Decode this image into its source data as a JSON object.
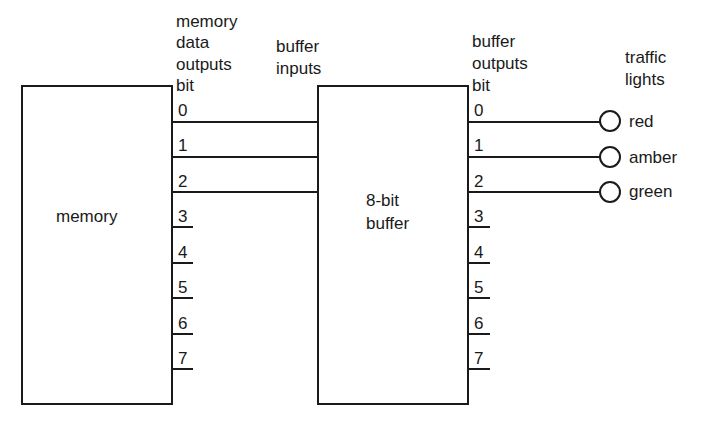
{
  "diagram": {
    "memory_block": {
      "label": "memory",
      "header_lines": [
        "memory",
        "data",
        "outputs",
        "bit"
      ],
      "bits": [
        "0",
        "1",
        "2",
        "3",
        "4",
        "5",
        "6",
        "7"
      ]
    },
    "buffer_block": {
      "label_lines": [
        "8-bit",
        "buffer"
      ],
      "input_header_lines": [
        "buffer",
        "inputs"
      ],
      "output_header_lines": [
        "buffer",
        "outputs",
        "bit"
      ],
      "bits": [
        "0",
        "1",
        "2",
        "3",
        "4",
        "5",
        "6",
        "7"
      ]
    },
    "traffic_lights": {
      "header_lines": [
        "traffic",
        "lights"
      ],
      "lamps": [
        {
          "bit": "0",
          "label": "red"
        },
        {
          "bit": "1",
          "label": "amber"
        },
        {
          "bit": "2",
          "label": "green"
        }
      ]
    },
    "connections": [
      {
        "from": "memory bit 0",
        "to": "buffer input 0"
      },
      {
        "from": "memory bit 1",
        "to": "buffer input 1"
      },
      {
        "from": "memory bit 2",
        "to": "buffer input 2"
      },
      {
        "from": "buffer output bit 0",
        "to": "red"
      },
      {
        "from": "buffer output bit 1",
        "to": "amber"
      },
      {
        "from": "buffer output bit 2",
        "to": "green"
      }
    ]
  }
}
